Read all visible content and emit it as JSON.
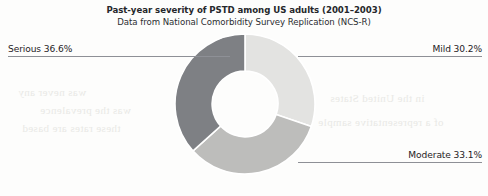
{
  "chart_data": {
    "type": "pie",
    "variant": "donut",
    "title": "Past-year severity of PSTD among US adults (2001–2003)",
    "subtitle": "Data from National Comorbidity Survey Replication (NCS-R)",
    "categories": [
      "Mild",
      "Moderate",
      "Serious"
    ],
    "values": [
      30.2,
      33.1,
      36.6
    ],
    "unit": "%",
    "slices": [
      {
        "label": "Mild",
        "value": 30.2,
        "display": "Mild 30.2%",
        "color": "#e3e3e1",
        "start_angle_deg": 0.0,
        "end_angle_deg": 108.7
      },
      {
        "label": "Moderate",
        "value": 33.1,
        "display": "Moderate 33.1%",
        "color": "#bdbdbb",
        "start_angle_deg": 108.7,
        "end_angle_deg": 227.9
      },
      {
        "label": "Serious",
        "value": 36.6,
        "display": "Serious 36.6%",
        "color": "#7e8084",
        "start_angle_deg": 227.9,
        "end_angle_deg": 360.0
      }
    ],
    "legend_position": "callout-labels",
    "grid": false,
    "start_angle": "12 o'clock",
    "direction": "clockwise",
    "inner_radius_ratio": 0.47
  },
  "callouts": {
    "serious": {
      "name": "Serious",
      "text": "Serious 36.6%"
    },
    "mild": {
      "name": "Mild",
      "text": "Mild 30.2%"
    },
    "moderate": {
      "name": "Moderate",
      "text": "Moderate 33.1%"
    }
  },
  "bleed_text": {
    "l1": "was never any",
    "l2": "was the prevalence",
    "l3": "these rates are based",
    "l4": "in the United States",
    "l5": "of a representative sample"
  }
}
